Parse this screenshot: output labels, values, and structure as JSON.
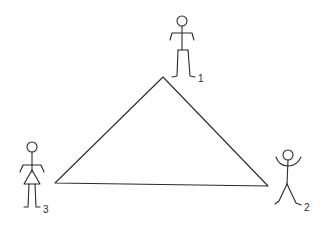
{
  "diagram": {
    "type": "triangle-with-stick-figures",
    "colors": {
      "line": "#2a2a2a",
      "background": "#ffffff"
    },
    "triangle": {
      "vertices": [
        {
          "id": "apex",
          "x": 163,
          "y": 77
        },
        {
          "id": "left",
          "x": 55,
          "y": 183
        },
        {
          "id": "right",
          "x": 268,
          "y": 186
        }
      ]
    },
    "figures": [
      {
        "id": "figure-1",
        "label": "1",
        "pose": "standing, arms down",
        "position": "top"
      },
      {
        "id": "figure-2",
        "label": "2",
        "pose": "arms raised, legs apart",
        "position": "bottom-right"
      },
      {
        "id": "figure-3",
        "label": "3",
        "pose": "standing, wearing skirt",
        "position": "bottom-left"
      }
    ]
  }
}
